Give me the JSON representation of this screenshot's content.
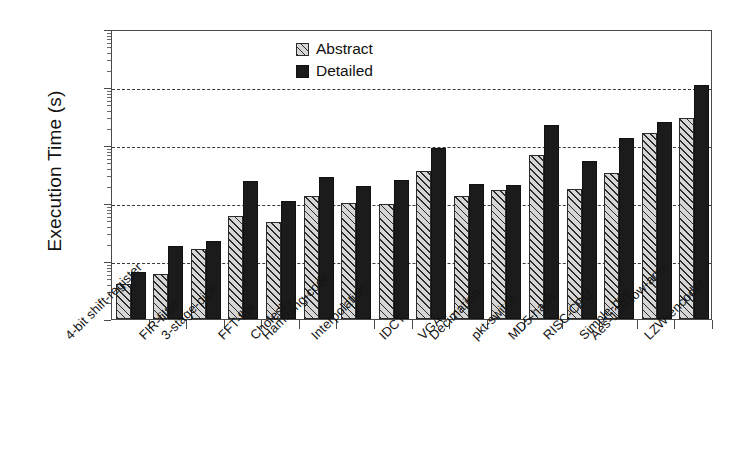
{
  "chart_data": {
    "type": "bar",
    "title": "",
    "xlabel": "",
    "ylabel": "Execution Time (s)",
    "yscale": "log",
    "ylim": [
      1,
      100000
    ],
    "yticks": [
      1,
      10,
      100,
      1000,
      10000,
      100000
    ],
    "ytick_labels": [
      "1",
      "10",
      "100",
      "1000",
      "10000",
      "100000"
    ],
    "grid": "horizontal-dashed",
    "legend_position": "top-center",
    "categories": [
      "4-bit shift-register",
      "FIR-filter",
      "3-stage-pipe",
      "FFT-flpt",
      "Cholesky",
      "Hamming-code",
      "Interpolation",
      "IDCT",
      "VGA",
      "Decimation",
      "pkt-switch",
      "MD5-hash",
      "RISC-CPU",
      "Simple-bus",
      "Aes-128-low-area",
      "LZW-encoder"
    ],
    "series": [
      {
        "name": "Abstract",
        "color": "#d6d6d6",
        "pattern": "diagonal-hatch",
        "values": [
          4,
          6,
          16,
          60,
          48,
          130,
          100,
          97,
          355,
          130,
          170,
          670,
          175,
          330,
          1600,
          2900
        ]
      },
      {
        "name": "Detailed",
        "color": "#1b1b1b",
        "pattern": "solid",
        "values": [
          6.5,
          18,
          22,
          235,
          110,
          285,
          200,
          245,
          880,
          215,
          205,
          2200,
          540,
          1300,
          2500,
          11000
        ]
      }
    ]
  },
  "legend": {
    "entries": [
      {
        "label": "Abstract"
      },
      {
        "label": "Detailed"
      }
    ]
  },
  "axis": {
    "y_title": "Execution Time (s)"
  }
}
